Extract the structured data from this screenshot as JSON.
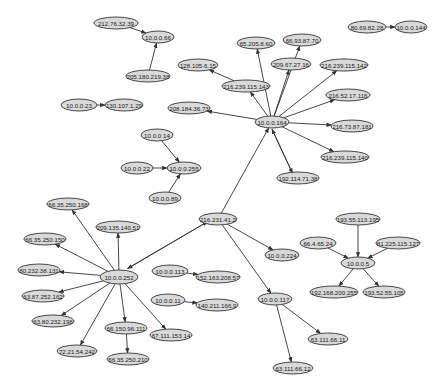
{
  "colors": {
    "node_fill": "#d9d9d9",
    "node_stroke": "#333333",
    "edge": "#333333",
    "background": "#ffffff"
  },
  "nodes": [
    {
      "id": "n1",
      "label": "212.76.32.39",
      "x": 116,
      "y": 23,
      "rx": 22,
      "ry": 6
    },
    {
      "id": "n2",
      "label": "10.0.0.66",
      "x": 158,
      "y": 37,
      "rx": 16,
      "ry": 6
    },
    {
      "id": "n3",
      "label": "205.180.219.38",
      "x": 148,
      "y": 76,
      "rx": 22,
      "ry": 6
    },
    {
      "id": "n4",
      "label": "10.0.0.23",
      "x": 79,
      "y": 105,
      "rx": 18,
      "ry": 6
    },
    {
      "id": "n5",
      "label": "130.107.1.29",
      "x": 124,
      "y": 105,
      "rx": 19,
      "ry": 6
    },
    {
      "id": "n6",
      "label": "80.69.82.28",
      "x": 367,
      "y": 27,
      "rx": 19,
      "ry": 6
    },
    {
      "id": "n7",
      "label": "10.0.0.144",
      "x": 411,
      "y": 27,
      "rx": 16,
      "ry": 6
    },
    {
      "id": "n8",
      "label": "65.205.8.60",
      "x": 256,
      "y": 43,
      "rx": 19,
      "ry": 6
    },
    {
      "id": "n9",
      "label": "66.93.87.70",
      "x": 302,
      "y": 40,
      "rx": 19,
      "ry": 6
    },
    {
      "id": "n10",
      "label": "128.105.6.15",
      "x": 198,
      "y": 65,
      "rx": 20,
      "ry": 6
    },
    {
      "id": "n11",
      "label": "209.67.27.16",
      "x": 291,
      "y": 64,
      "rx": 20,
      "ry": 6
    },
    {
      "id": "n12",
      "label": "216.239.115.142",
      "x": 344,
      "y": 65,
      "rx": 24,
      "ry": 6
    },
    {
      "id": "n13",
      "label": "216.239.115.143",
      "x": 246,
      "y": 86,
      "rx": 24,
      "ry": 6
    },
    {
      "id": "n14",
      "label": "216.52.17.116",
      "x": 348,
      "y": 95,
      "rx": 22,
      "ry": 6
    },
    {
      "id": "n15",
      "label": "208.184.36.73",
      "x": 189,
      "y": 108,
      "rx": 21,
      "ry": 6
    },
    {
      "id": "n16",
      "label": "10.0.0.164",
      "x": 272,
      "y": 122,
      "rx": 17,
      "ry": 6
    },
    {
      "id": "n17",
      "label": "216.73.87.181",
      "x": 352,
      "y": 126,
      "rx": 21,
      "ry": 6
    },
    {
      "id": "n18",
      "label": "216.239.115.140",
      "x": 345,
      "y": 157,
      "rx": 24,
      "ry": 6
    },
    {
      "id": "n19",
      "label": "192.114.71.38",
      "x": 298,
      "y": 178,
      "rx": 21,
      "ry": 6
    },
    {
      "id": "n20",
      "label": "10.0.0.14",
      "x": 157,
      "y": 135,
      "rx": 16,
      "ry": 6
    },
    {
      "id": "n21",
      "label": "10.0.0.22",
      "x": 137,
      "y": 168,
      "rx": 16,
      "ry": 6
    },
    {
      "id": "n22",
      "label": "10.0.0.255",
      "x": 184,
      "y": 168,
      "rx": 17,
      "ry": 6
    },
    {
      "id": "n23",
      "label": "10.0.0.89",
      "x": 165,
      "y": 198,
      "rx": 16,
      "ry": 6
    },
    {
      "id": "n24",
      "label": "216.231.41.2",
      "x": 218,
      "y": 219,
      "rx": 19,
      "ry": 6
    },
    {
      "id": "n25",
      "label": "10.0.0.224",
      "x": 282,
      "y": 255,
      "rx": 17,
      "ry": 6
    },
    {
      "id": "n26",
      "label": "66.35.250.168",
      "x": 68,
      "y": 204,
      "rx": 21,
      "ry": 6
    },
    {
      "id": "n27",
      "label": "209.135.140.51",
      "x": 118,
      "y": 227,
      "rx": 22,
      "ry": 6
    },
    {
      "id": "n28",
      "label": "66.35.250.150",
      "x": 45,
      "y": 239,
      "rx": 21,
      "ry": 6
    },
    {
      "id": "n29",
      "label": "80.232.38.131",
      "x": 39,
      "y": 270,
      "rx": 21,
      "ry": 6
    },
    {
      "id": "n30",
      "label": "10.0.0.252",
      "x": 119,
      "y": 277,
      "rx": 19,
      "ry": 7
    },
    {
      "id": "n31",
      "label": "63.87.252.162",
      "x": 43,
      "y": 296,
      "rx": 21,
      "ry": 6
    },
    {
      "id": "n32",
      "label": "63.80.232.198",
      "x": 53,
      "y": 321,
      "rx": 21,
      "ry": 6
    },
    {
      "id": "n33",
      "label": "66.150.96.111",
      "x": 126,
      "y": 328,
      "rx": 21,
      "ry": 6
    },
    {
      "id": "n34",
      "label": "72.21.54.242",
      "x": 77,
      "y": 351,
      "rx": 20,
      "ry": 6
    },
    {
      "id": "n35",
      "label": "66.35.250.210",
      "x": 128,
      "y": 359,
      "rx": 21,
      "ry": 6
    },
    {
      "id": "n36",
      "label": "67.111.153.14",
      "x": 171,
      "y": 335,
      "rx": 21,
      "ry": 6
    },
    {
      "id": "n37",
      "label": "10.0.0.113",
      "x": 170,
      "y": 271,
      "rx": 18,
      "ry": 6
    },
    {
      "id": "n38",
      "label": "152.163.208.57",
      "x": 218,
      "y": 277,
      "rx": 22,
      "ry": 6
    },
    {
      "id": "n39",
      "label": "10.0.0.11",
      "x": 168,
      "y": 300,
      "rx": 17,
      "ry": 6
    },
    {
      "id": "n40",
      "label": "140.211.166.9",
      "x": 217,
      "y": 305,
      "rx": 21,
      "ry": 6
    },
    {
      "id": "n41",
      "label": "10.0.0.117",
      "x": 275,
      "y": 299,
      "rx": 17,
      "ry": 6
    },
    {
      "id": "n42",
      "label": "63.111.66.11",
      "x": 328,
      "y": 339,
      "rx": 20,
      "ry": 6
    },
    {
      "id": "n43",
      "label": "63.111.66.12",
      "x": 293,
      "y": 368,
      "rx": 20,
      "ry": 6
    },
    {
      "id": "n44",
      "label": "193.55.113.195",
      "x": 358,
      "y": 219,
      "rx": 22,
      "ry": 6
    },
    {
      "id": "n45",
      "label": "66.4.65.24",
      "x": 318,
      "y": 243,
      "rx": 18,
      "ry": 6
    },
    {
      "id": "n46",
      "label": "81.225.115.127",
      "x": 398,
      "y": 243,
      "rx": 22,
      "ry": 6
    },
    {
      "id": "n47",
      "label": "10.0.0.5",
      "x": 358,
      "y": 263,
      "rx": 17,
      "ry": 6
    },
    {
      "id": "n48",
      "label": "192.168.200.255",
      "x": 334,
      "y": 292,
      "rx": 24,
      "ry": 6
    },
    {
      "id": "n49",
      "label": "193.52.55.105",
      "x": 384,
      "y": 292,
      "rx": 21,
      "ry": 6
    }
  ],
  "edges": [
    {
      "from": "n1",
      "to": "n2"
    },
    {
      "from": "n3",
      "to": "n2"
    },
    {
      "from": "n4",
      "to": "n5"
    },
    {
      "from": "n6",
      "to": "n7"
    },
    {
      "from": "n16",
      "to": "n8"
    },
    {
      "from": "n16",
      "to": "n9"
    },
    {
      "from": "n16",
      "to": "n11"
    },
    {
      "from": "n16",
      "to": "n12"
    },
    {
      "from": "n16",
      "to": "n13"
    },
    {
      "from": "n13",
      "to": "n10"
    },
    {
      "from": "n16",
      "to": "n14"
    },
    {
      "from": "n16",
      "to": "n15"
    },
    {
      "from": "n16",
      "to": "n17"
    },
    {
      "from": "n16",
      "to": "n18"
    },
    {
      "from": "n16",
      "to": "n19"
    },
    {
      "from": "n19",
      "to": "n16"
    },
    {
      "from": "n24",
      "to": "n16"
    },
    {
      "from": "n20",
      "to": "n22"
    },
    {
      "from": "n21",
      "to": "n22"
    },
    {
      "from": "n23",
      "to": "n22"
    },
    {
      "from": "n30",
      "to": "n24"
    },
    {
      "from": "n24",
      "to": "n30"
    },
    {
      "from": "n24",
      "to": "n25"
    },
    {
      "from": "n24",
      "to": "n41"
    },
    {
      "from": "n30",
      "to": "n26"
    },
    {
      "from": "n30",
      "to": "n27"
    },
    {
      "from": "n30",
      "to": "n28"
    },
    {
      "from": "n30",
      "to": "n29"
    },
    {
      "from": "n30",
      "to": "n31"
    },
    {
      "from": "n30",
      "to": "n32"
    },
    {
      "from": "n30",
      "to": "n33"
    },
    {
      "from": "n30",
      "to": "n34"
    },
    {
      "from": "n30",
      "to": "n36"
    },
    {
      "from": "n33",
      "to": "n35"
    },
    {
      "from": "n37",
      "to": "n38"
    },
    {
      "from": "n39",
      "to": "n40"
    },
    {
      "from": "n41",
      "to": "n42"
    },
    {
      "from": "n41",
      "to": "n43"
    },
    {
      "from": "n44",
      "to": "n47"
    },
    {
      "from": "n45",
      "to": "n47"
    },
    {
      "from": "n46",
      "to": "n47"
    },
    {
      "from": "n47",
      "to": "n48"
    },
    {
      "from": "n47",
      "to": "n49"
    }
  ]
}
